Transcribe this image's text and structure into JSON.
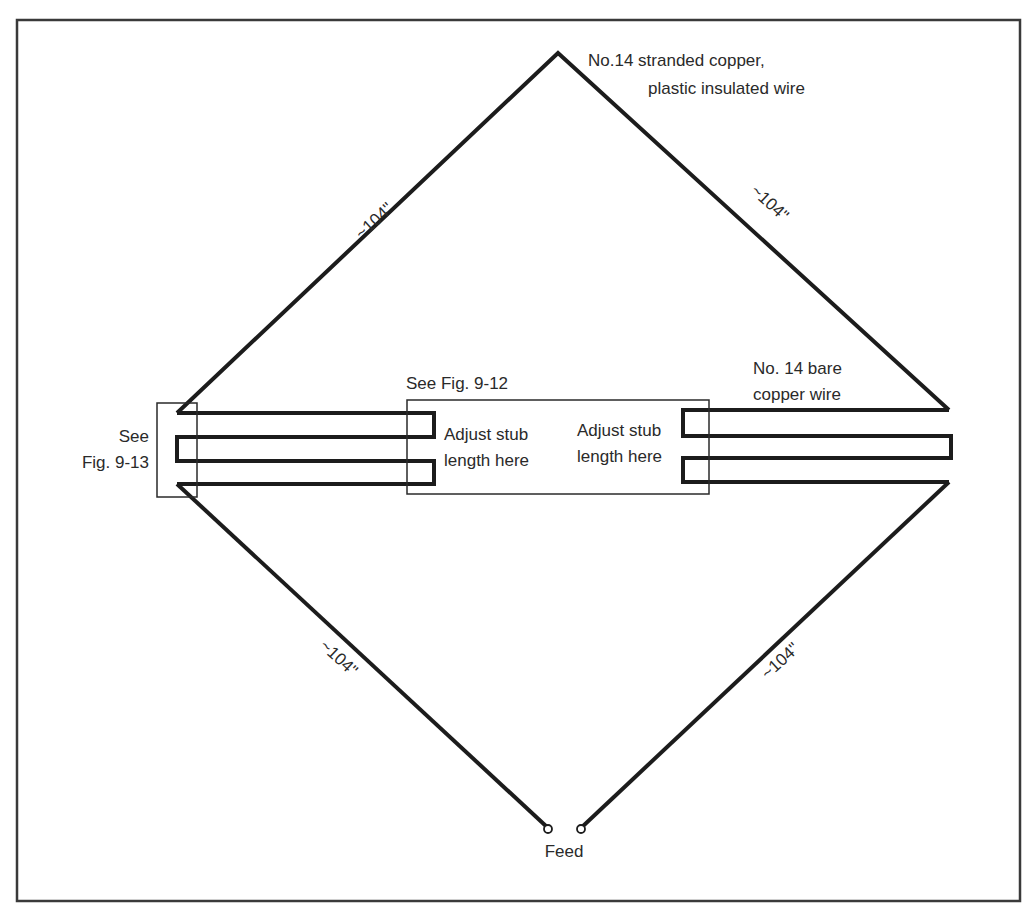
{
  "figure": {
    "type": "antenna-wiring-diagram",
    "labels": {
      "top_wire_line1": "No.14 stranded copper,",
      "top_wire_line2": "plastic insulated wire",
      "bare_wire_line1": "No. 14 bare",
      "bare_wire_line2": "copper wire",
      "see_fig_left_line1": "See",
      "see_fig_left_line2": "Fig. 9-13",
      "see_fig_center": "See Fig. 9-12",
      "adjust_left_line1": "Adjust stub",
      "adjust_left_line2": "length here",
      "adjust_right_line1": "Adjust stub",
      "adjust_right_line2": "length here",
      "feed": "Feed"
    },
    "dimensions": {
      "upper_left": "~104\"",
      "upper_right": "~104\"",
      "lower_left": "~104\"",
      "lower_right": "~104\""
    },
    "colors": {
      "line": "#1c1c1c",
      "text": "#2a2a2a",
      "background": "#ffffff"
    }
  }
}
